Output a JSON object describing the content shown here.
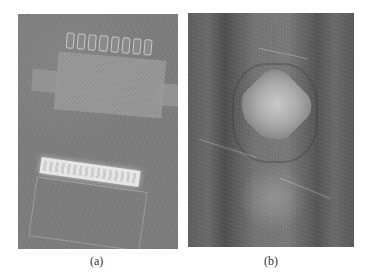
{
  "figure": {
    "panels": [
      {
        "id": "a",
        "caption": "(a)",
        "description": "Grayscale photograph of an electronic component (chip package with a row of pads) above a bright label strip on a textured board"
      },
      {
        "id": "b",
        "caption": "(b)",
        "description": "Grayscale noisy image showing a bright diamond-shaped region (weld nugget) within darker vertical bands"
      }
    ]
  }
}
